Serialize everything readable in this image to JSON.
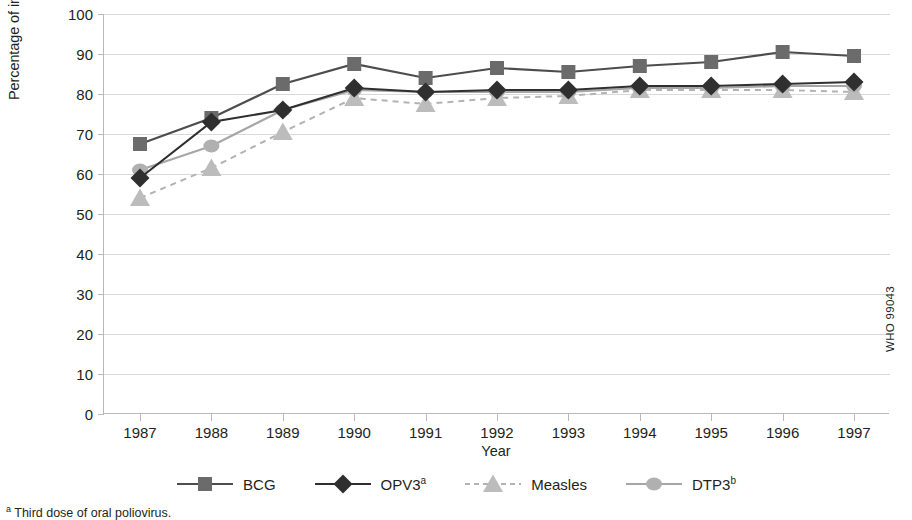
{
  "chart_data": {
    "type": "line",
    "title": "",
    "xlabel": "Year",
    "ylabel": "Percentage of infants immunized",
    "categories": [
      "1987",
      "1988",
      "1989",
      "1990",
      "1991",
      "1992",
      "1993",
      "1994",
      "1995",
      "1996",
      "1997"
    ],
    "x": [
      1987,
      1988,
      1989,
      1990,
      1991,
      1992,
      1993,
      1994,
      1995,
      1996,
      1997
    ],
    "ylim": [
      0,
      100
    ],
    "yticks": [
      0,
      10,
      20,
      30,
      40,
      50,
      60,
      70,
      80,
      90,
      100
    ],
    "grid": true,
    "legend_position": "bottom",
    "series": [
      {
        "name": "BCG",
        "label": "BCG",
        "marker": "square",
        "linestyle": "solid",
        "color": "#6b6b6b",
        "line_color": "#4d4d4d",
        "values": [
          67.5,
          74.0,
          82.5,
          87.5,
          84.0,
          86.5,
          85.5,
          87.0,
          88.0,
          90.5,
          89.5
        ]
      },
      {
        "name": "OPV3",
        "label": "OPV3",
        "label_sup": "a",
        "marker": "diamond",
        "linestyle": "solid",
        "color": "#2f2f2f",
        "line_color": "#2f2f2f",
        "values": [
          59.0,
          73.0,
          76.0,
          81.5,
          80.5,
          81.0,
          81.0,
          82.0,
          82.0,
          82.5,
          83.0
        ]
      },
      {
        "name": "Measles",
        "label": "Measles",
        "marker": "triangle",
        "linestyle": "dashed",
        "color": "#bcbcbc",
        "line_color": "#b3b3b3",
        "values": [
          54.0,
          61.5,
          70.5,
          79.0,
          77.5,
          79.0,
          79.5,
          81.0,
          81.0,
          81.0,
          80.5
        ]
      },
      {
        "name": "DTP3",
        "label": "DTP3",
        "label_sup": "b",
        "marker": "circle",
        "linestyle": "solid",
        "color": "#b0b0b0",
        "line_color": "#a6a6a6",
        "values": [
          61.0,
          67.0,
          76.0,
          81.0,
          80.5,
          80.5,
          80.5,
          81.5,
          81.5,
          82.0,
          82.0
        ]
      }
    ]
  },
  "annotations": {
    "who_code": "WHO 99043"
  },
  "footnotes": [
    {
      "marker": "a",
      "text": " Third dose of oral poliovirus."
    }
  ],
  "colors": {
    "grid": "#d9d9d9",
    "axis": "#b9b9b9",
    "text": "#231f20",
    "bcg": "#6b6b6b",
    "opv3": "#2f2f2f",
    "measles": "#bcbcbc",
    "dtp3": "#b0b0b0"
  }
}
